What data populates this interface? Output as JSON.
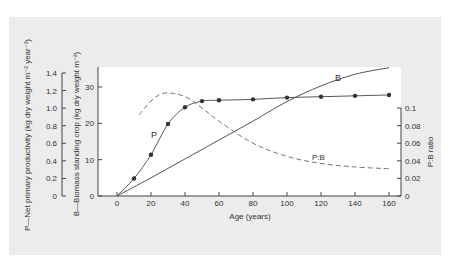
{
  "chart_data": {
    "type": "line",
    "title": "",
    "xlabel": "Age (years)",
    "x_ticks": [
      0,
      20,
      40,
      60,
      80,
      100,
      120,
      140,
      160
    ],
    "xlim": [
      0,
      160
    ],
    "axes": {
      "p_axis": {
        "label": "P—Net primary productivity (kg dry weight m⁻² year⁻¹)",
        "ticks": [
          "0",
          "0.2",
          "0.4",
          "0.6",
          "0.8",
          "1.0",
          "1.2",
          "1.4"
        ],
        "range": [
          0,
          1.4
        ]
      },
      "b_axis": {
        "label": "B—Biomass standing crop (kg dry weight m⁻²)",
        "ticks": [
          "0",
          "10",
          "20",
          "30"
        ],
        "range": [
          0,
          35
        ]
      },
      "ratio_axis": {
        "label": "P:B ratio",
        "ticks": [
          "0",
          "0.02",
          "0.04",
          "0.06",
          "0.08",
          "0.1"
        ],
        "range": [
          0,
          0.1
        ]
      }
    },
    "series": [
      {
        "name": "P",
        "axis": "p_axis",
        "style": "solid-with-markers",
        "x": [
          0,
          10,
          20,
          30,
          40,
          50,
          60,
          80,
          100,
          120,
          140,
          160
        ],
        "values": [
          0,
          0.2,
          0.47,
          0.82,
          1.01,
          1.08,
          1.09,
          1.1,
          1.12,
          1.13,
          1.14,
          1.15
        ]
      },
      {
        "name": "B",
        "axis": "b_axis",
        "style": "solid",
        "x": [
          0,
          20,
          40,
          60,
          80,
          100,
          120,
          140,
          160
        ],
        "values": [
          0,
          5,
          10.2,
          15.4,
          20.6,
          26,
          30.3,
          33.5,
          35.3
        ]
      },
      {
        "name": "P:B",
        "axis": "ratio_axis",
        "style": "dashed",
        "x": [
          13,
          20,
          28,
          40,
          50,
          60,
          80,
          100,
          120,
          140,
          160
        ],
        "values": [
          0.092,
          0.108,
          0.117,
          0.113,
          0.1,
          0.085,
          0.06,
          0.045,
          0.037,
          0.033,
          0.031
        ]
      }
    ],
    "annotations": [
      "P",
      "B",
      "P:B"
    ],
    "grid": false,
    "legend": "none (inline labels)"
  },
  "labels": {
    "xlabel": "Age (years)",
    "p_axis_label": "P—Net primary productivity (kg dry weight m⁻² year⁻¹)",
    "b_axis_label": "B—Biomass standing crop (kg dry weight m⁻²)",
    "ratio_axis_label": "P:B ratio",
    "curve_p": "P",
    "curve_b": "B",
    "curve_pb": "P:B"
  }
}
